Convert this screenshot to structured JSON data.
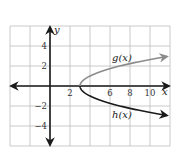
{
  "chart_data": {
    "type": "line",
    "title": "",
    "xlabel": "x",
    "ylabel": "y",
    "xlim": [
      -4,
      12
    ],
    "ylim": [
      -6,
      6
    ],
    "grid": true,
    "grid_step": 2,
    "x_ticks": [
      {
        "value": 2,
        "label": "2"
      },
      {
        "value": 6,
        "label": "6"
      },
      {
        "value": 8,
        "label": "8"
      },
      {
        "value": 10,
        "label": "10"
      }
    ],
    "y_ticks": [
      {
        "value": 4,
        "label": "4"
      },
      {
        "value": 2,
        "label": "2"
      },
      {
        "value": -2,
        "label": "−2"
      },
      {
        "value": -4,
        "label": "−4"
      }
    ],
    "series": [
      {
        "name": "g(x)",
        "label": "g(x)",
        "equation": "y = sqrt(x - 3)",
        "color": "#8c8c8c",
        "x": [
          3,
          3.25,
          4,
          5,
          6,
          7,
          8,
          9,
          10,
          11,
          11.7
        ],
        "values": [
          0,
          0.5,
          1,
          1.41,
          1.73,
          2,
          2.24,
          2.45,
          2.65,
          2.83,
          2.95
        ]
      },
      {
        "name": "h(x)",
        "label": "h(x)",
        "equation": "y = -sqrt(x - 3)",
        "color": "#1a1a1a",
        "x": [
          3,
          3.25,
          4,
          5,
          6,
          7,
          8,
          9,
          10,
          11,
          11.7
        ],
        "values": [
          0,
          -0.5,
          -1,
          -1.41,
          -1.73,
          -2,
          -2.24,
          -2.45,
          -2.65,
          -2.83,
          -2.95
        ]
      }
    ],
    "annotations": [
      {
        "text": "g(x)",
        "x": 6.2,
        "y": 2.8
      },
      {
        "text": "h(x)",
        "x": 6.2,
        "y": -2.9
      }
    ],
    "legend": "none (inline labels)"
  },
  "colors": {
    "grid": "#bdbdbd",
    "axis": "#1a1a1a",
    "g_curve": "#8c8c8c",
    "h_curve": "#1a1a1a"
  }
}
